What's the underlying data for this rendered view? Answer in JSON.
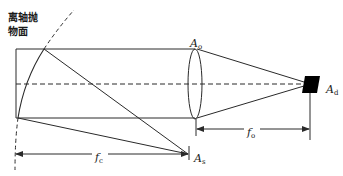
{
  "diagram": {
    "title_mirror_line1": "离轴抛",
    "title_mirror_line2": "物面",
    "labels": {
      "aperture_objective": {
        "symbol": "A",
        "sub": "o"
      },
      "detector": {
        "symbol": "A",
        "sub": "d"
      },
      "source_aperture": {
        "symbol": "A",
        "sub": "s"
      },
      "focal_collimator": {
        "symbol": "f",
        "sub": "c"
      },
      "focal_objective": {
        "symbol": "f",
        "sub": "o"
      }
    },
    "colors": {
      "line": "#2a2a2a",
      "detector_fill": "#000000",
      "background": "#ffffff"
    }
  }
}
